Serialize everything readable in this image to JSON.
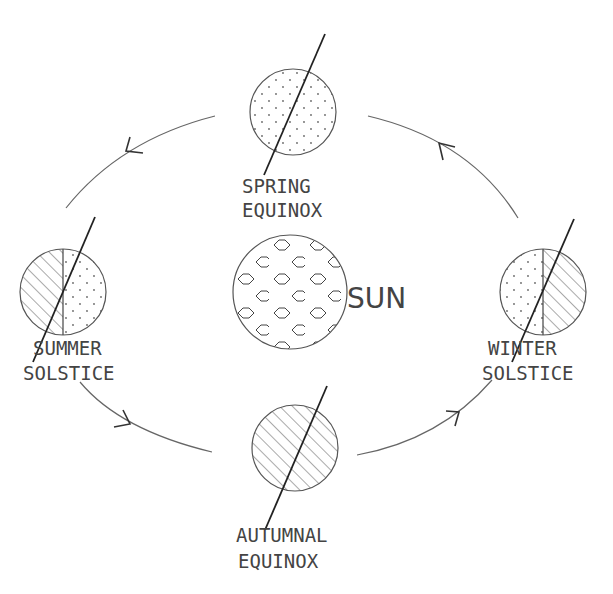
{
  "diagram": {
    "sun": {
      "label": "SUN",
      "pattern": "hexagon"
    },
    "positions": [
      {
        "id": "spring",
        "label_line1": "SPRING",
        "label_line2": "EQUINOX",
        "fill": "dotted"
      },
      {
        "id": "summer",
        "label_line1": "SUMMER",
        "label_line2": "SOLSTICE",
        "fill": "left-hatched-right-dotted"
      },
      {
        "id": "winter",
        "label_line1": "WINTER",
        "label_line2": "SOLSTICE",
        "fill": "left-dotted-right-hatched"
      },
      {
        "id": "autumn",
        "label_line1": "AUTUMNAL",
        "label_line2": "EQUINOX",
        "fill": "hatched"
      }
    ],
    "orbit_direction": "counter-clockwise",
    "colors": {
      "line": "#444444",
      "background": "#ffffff"
    }
  }
}
